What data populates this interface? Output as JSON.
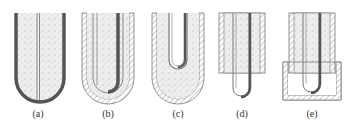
{
  "figure": {
    "panels": [
      {
        "id": "a",
        "label": "(a)",
        "description": "U-shaped tube filled with powder, thin center rod, thick outer wall"
      },
      {
        "id": "b",
        "label": "(b)",
        "description": "Concentric U-shaped tubes with hatched outer sleeve and offset dark rod"
      },
      {
        "id": "c",
        "label": "(c)",
        "description": "Outer hatched U shell with powder fill and inner hollow U tube"
      },
      {
        "id": "d",
        "label": "(d)",
        "description": "Rectangular hatched block with powder fill, U tube protruding below"
      },
      {
        "id": "e",
        "label": "(e)",
        "description": "Rectangular hatched block with U tube enclosed in hatched lower container"
      }
    ],
    "colors": {
      "wall_dark": "#555555",
      "line": "#777777",
      "powder_bg": "#eeeeee",
      "speckle": "#9a9a9a",
      "hatch": "#888888"
    }
  }
}
